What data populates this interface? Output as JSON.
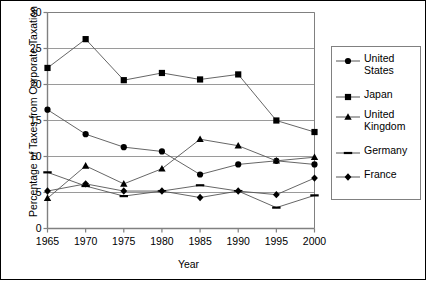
{
  "chart_data": {
    "type": "line",
    "title": "",
    "xlabel": "Year",
    "ylabel": "Percentage of Taxes from Corporate Taxation",
    "x": [
      1965,
      1970,
      1975,
      1980,
      1985,
      1990,
      1995,
      2000
    ],
    "xtick_labels": [
      "1965",
      "1970",
      "1975",
      "1980",
      "1985",
      "1990",
      "1995",
      "2000"
    ],
    "ytick_labels": [
      "0",
      "5",
      "10",
      "15",
      "20",
      "25",
      "30"
    ],
    "ylim": [
      0,
      30
    ],
    "xlim": [
      1965,
      2000
    ],
    "ytick_values": [
      0,
      5,
      10,
      15,
      20,
      25,
      30
    ],
    "grid": "horizontal",
    "legend_position": "right-outside",
    "series": [
      {
        "name": "United States",
        "marker": "circle",
        "color": "#000000",
        "values": [
          16.5,
          13.1,
          11.3,
          10.7,
          7.5,
          8.9,
          9.4,
          8.9
        ]
      },
      {
        "name": "Japan",
        "marker": "square",
        "color": "#000000",
        "values": [
          22.3,
          26.3,
          20.6,
          21.6,
          20.7,
          21.4,
          15.0,
          13.4
        ]
      },
      {
        "name": "United Kingdom",
        "marker": "triangle",
        "color": "#000000",
        "values": [
          4.2,
          8.7,
          6.2,
          8.3,
          12.4,
          11.5,
          9.4,
          9.9
        ]
      },
      {
        "name": "Germany",
        "marker": "dash",
        "color": "#000000",
        "values": [
          7.8,
          5.9,
          4.5,
          5.2,
          6.0,
          5.2,
          2.9,
          4.6
        ]
      },
      {
        "name": "France",
        "marker": "diamond",
        "color": "#000000",
        "values": [
          5.2,
          6.2,
          5.2,
          5.2,
          4.3,
          5.2,
          4.7,
          7.0
        ]
      }
    ]
  },
  "legend": {
    "items": [
      {
        "label_line1": "United",
        "label_line2": "States"
      },
      {
        "label_line1": "Japan",
        "label_line2": ""
      },
      {
        "label_line1": "United",
        "label_line2": "Kingdom"
      },
      {
        "label_line1": "Germany",
        "label_line2": ""
      },
      {
        "label_line1": "France",
        "label_line2": ""
      }
    ]
  },
  "style": {
    "axis_color": "#808080",
    "grid_color": "#9a9a9a",
    "line_color": "#555555",
    "marker_color": "#000000",
    "border_color": "#000000"
  }
}
